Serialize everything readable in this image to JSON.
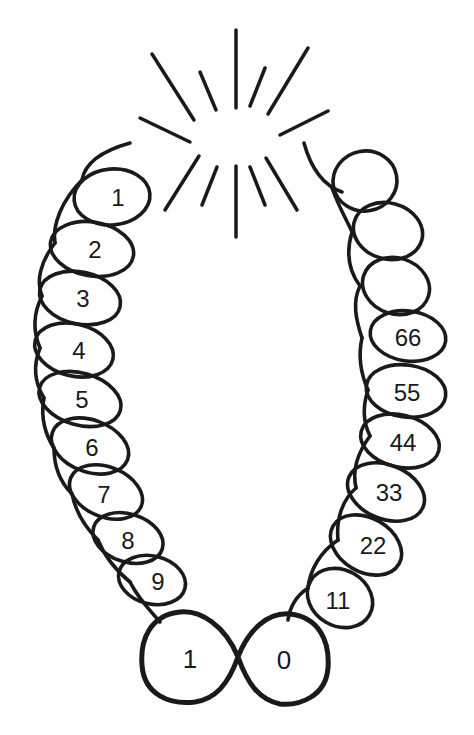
{
  "diagram": {
    "starburst": {
      "rays": 14
    },
    "left_loops": [
      "1",
      "2",
      "3",
      "4",
      "5",
      "6",
      "7",
      "8",
      "9"
    ],
    "bottom_loops": [
      "1",
      "0"
    ],
    "right_loops_numbered": [
      "11",
      "22",
      "33",
      "44",
      "55",
      "66"
    ],
    "right_loops_blank_count": 3,
    "colors": {
      "ink": "#1a1a1a",
      "background": "#ffffff"
    }
  }
}
